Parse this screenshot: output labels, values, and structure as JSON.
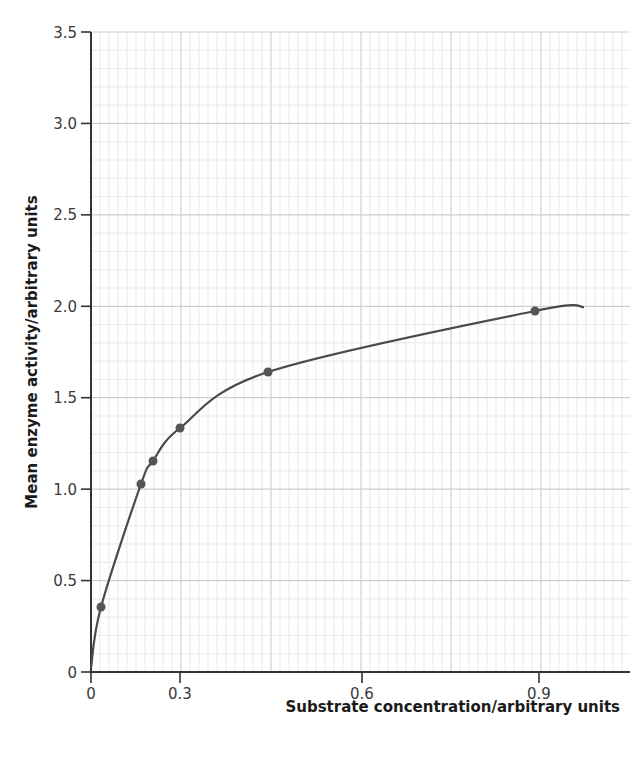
{
  "chart_data": {
    "type": "scatter",
    "title": "",
    "xlabel": "Substrate concentration/arbitrary units",
    "ylabel": "Mean enzyme activity/arbitrary units",
    "xlim": [
      0,
      1.0
    ],
    "ylim": [
      0,
      3.5
    ],
    "grid": true,
    "legend": null,
    "x_ticks": [
      {
        "label": "0",
        "px": 91
      },
      {
        "label": "0.3",
        "px": 180
      },
      {
        "label": "0.6",
        "px": 362
      },
      {
        "label": "0.9",
        "px": 539
      }
    ],
    "y_ticks": [
      "0",
      "0.5",
      "1.0",
      "1.5",
      "2.0",
      "2.5",
      "3.0",
      "3.5"
    ],
    "series": [
      {
        "name": "Mean enzyme activity",
        "points_px": [
          [
            101,
            607
          ],
          [
            141,
            484
          ],
          [
            153,
            461
          ],
          [
            180,
            428
          ],
          [
            268,
            372
          ],
          [
            535,
            311
          ]
        ],
        "x": [
          0.02,
          0.15,
          0.19,
          0.3,
          0.45,
          0.89
        ],
        "y": [
          0.35,
          1.03,
          1.15,
          1.33,
          1.64,
          1.97
        ],
        "fit_curve": "smooth saturation curve from origin to ~2.0 at x≈0.98"
      }
    ],
    "colors": {
      "line": "#4a4a4a",
      "point": "#555555",
      "grid_minor": "#e3e3e3",
      "grid_major": "#cfcfcf",
      "axis": "#333333"
    }
  }
}
